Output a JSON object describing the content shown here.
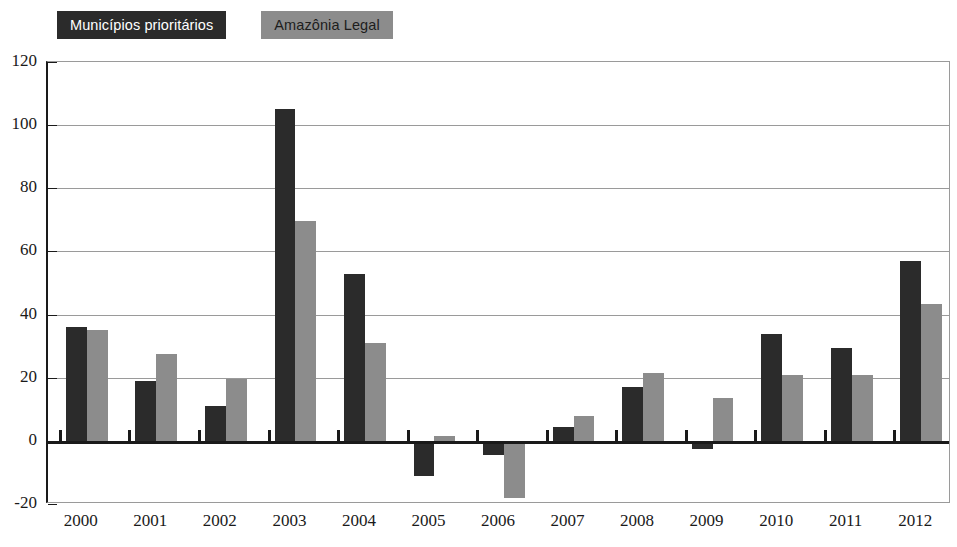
{
  "legend": {
    "items": [
      {
        "label": "Municípios prioritários",
        "color": "#2b2b2b",
        "text_color": "#ffffff"
      },
      {
        "label": "Amazônia Legal",
        "color": "#8c8c8c",
        "text_color": "#1d1d1d"
      }
    ]
  },
  "chart_data": {
    "type": "bar",
    "title": "",
    "subtitle": "",
    "xlabel": "",
    "ylabel": "",
    "grid": true,
    "legend_position": "top-left",
    "ylim": [
      -20,
      120
    ],
    "yticks": [
      120,
      100,
      80,
      60,
      40,
      20,
      0,
      -20
    ],
    "ytick_labels": [
      "120",
      "100",
      "80",
      "60",
      "40",
      "20",
      "0",
      "-20"
    ],
    "categories": [
      "2000",
      "2001",
      "2002",
      "2003",
      "2004",
      "2005",
      "2006",
      "2007",
      "2008",
      "2009",
      "2010",
      "2011",
      "2012"
    ],
    "series": [
      {
        "name": "Municípios prioritários",
        "color": "#2b2b2b",
        "values": [
          36,
          19,
          11,
          105,
          53,
          -11,
          -4.5,
          4.5,
          17,
          -2.5,
          34,
          29.5,
          57
        ]
      },
      {
        "name": "Amazônia Legal",
        "color": "#8c8c8c",
        "values": [
          35,
          27.5,
          19.5,
          69.5,
          31,
          1.5,
          -18,
          8,
          21.5,
          13.5,
          21,
          21,
          43.5
        ]
      }
    ]
  }
}
